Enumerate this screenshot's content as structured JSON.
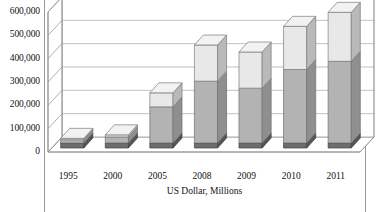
{
  "chart_data": {
    "type": "bar",
    "subtype": "stacked-bar-3d",
    "title": "",
    "subtitle": "",
    "xlabel": "US Dollar, Millions",
    "ylabel": "",
    "categories": [
      "1995",
      "2000",
      "2005",
      "2008",
      "2009",
      "2010",
      "2011"
    ],
    "series": [
      {
        "name": "lower-segment",
        "color": "#b3b3b3",
        "values": [
          14000,
          26000,
          155000,
          265000,
          235000,
          315000,
          350000
        ]
      },
      {
        "name": "upper-segment",
        "color": "#e8e8e8",
        "values": [
          6000,
          9000,
          60000,
          155000,
          155000,
          185000,
          210000
        ]
      }
    ],
    "totals": [
      20000,
      35000,
      215000,
      420000,
      390000,
      500000,
      560000
    ],
    "ylim": [
      0,
      600000
    ],
    "ytick_values": [
      0,
      100000,
      200000,
      300000,
      400000,
      500000,
      600000
    ],
    "ytick_labels": [
      "0",
      "100,000",
      "200,000",
      "300,000",
      "400,000",
      "500,000",
      "600,000"
    ],
    "grid": true,
    "gridlines": "horizontal-back-wall",
    "legend": "none",
    "legend_position": "none",
    "annotations": []
  },
  "style": {
    "segment_lower_front": "#b3b3b3",
    "segment_lower_side": "#8f8f8f",
    "segment_lower_top": "#c9c9c9",
    "segment_upper_front": "#e8e8e8",
    "segment_upper_side": "#b9b9b9",
    "segment_upper_top": "#f2f2f2",
    "base_front": "#6e6e6e",
    "base_side": "#555555",
    "grid_color": "#a8a8a8",
    "axis_color": "#8c8c8c",
    "wall_color": "#ffffff",
    "floor_color": "#ffffff",
    "frame_color": "#9a9a9a",
    "text_color": "#111111"
  }
}
